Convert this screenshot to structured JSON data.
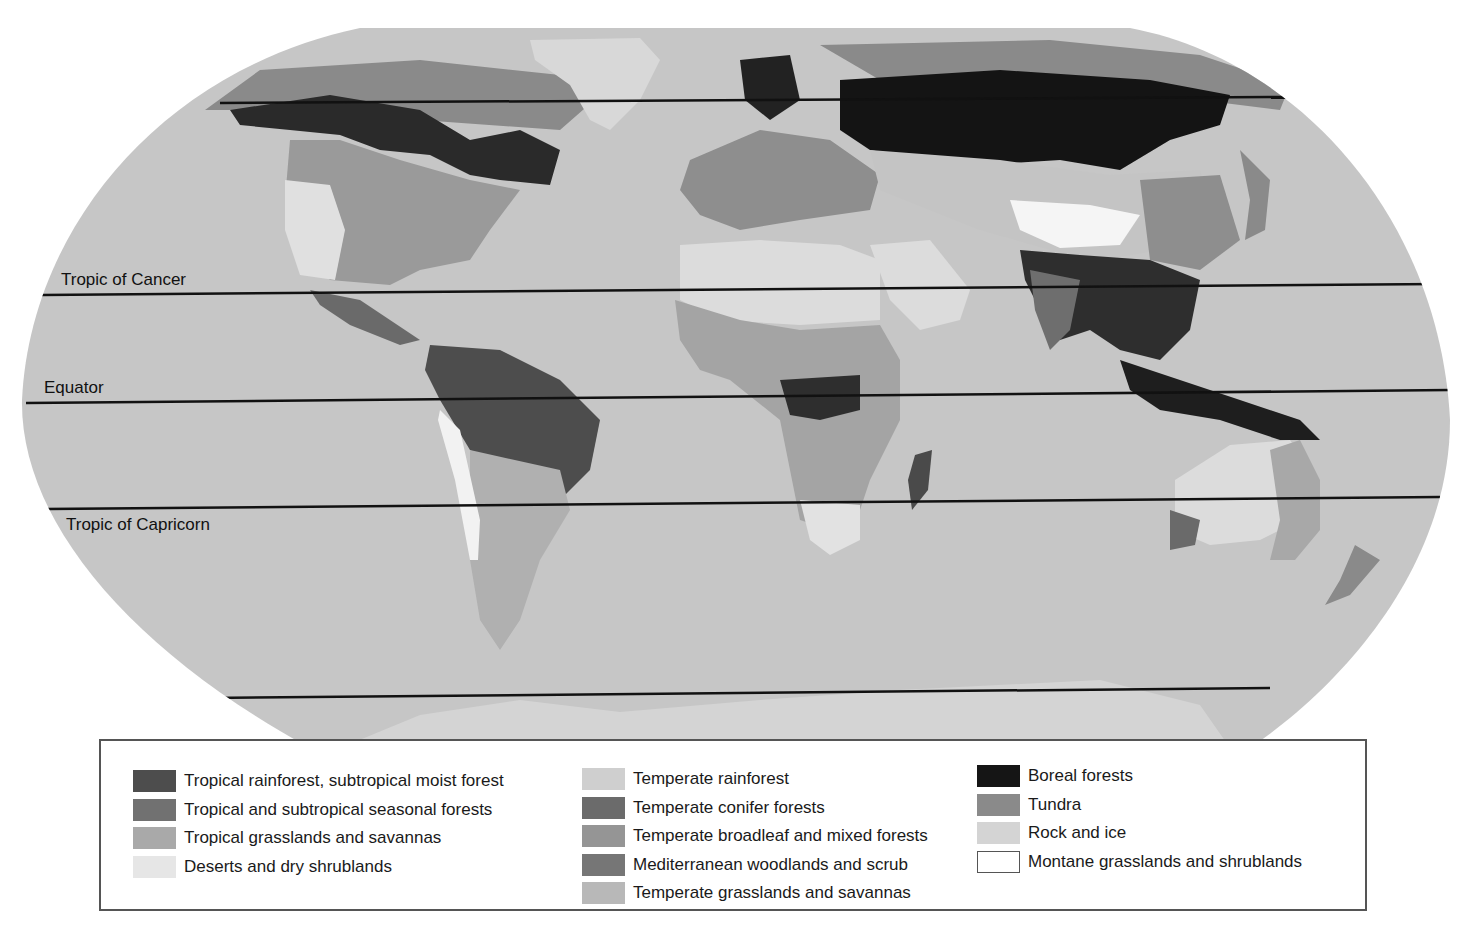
{
  "map": {
    "title": "World biomes map",
    "projection": "Robinson-like oval",
    "ocean_color": "#c6c6c6",
    "latitude_lines": [
      {
        "name": "Arctic Circle",
        "label": "",
        "y": 103
      },
      {
        "name": "Tropic of Cancer",
        "label": "Tropic of Cancer",
        "y": 289
      },
      {
        "name": "Equator",
        "label": "Equator",
        "y": 397
      },
      {
        "name": "Tropic of Capricorn",
        "label": "Tropic of Capricorn",
        "y": 503
      },
      {
        "name": "Antarctic Circle",
        "label": "",
        "y": 692
      }
    ]
  },
  "legend": {
    "columns": [
      [
        {
          "label": "Tropical rainforest, subtropical moist forest",
          "color": "#4d4d4d"
        },
        {
          "label": "Tropical and subtropical seasonal forests",
          "color": "#717171"
        },
        {
          "label": "Tropical grasslands and savannas",
          "color": "#a9a9a9"
        },
        {
          "label": "Deserts and dry shrublands",
          "color": "#e2e2e2"
        }
      ],
      [
        {
          "label": "Temperate rainforest",
          "color": "#cfcfcf"
        },
        {
          "label": "Temperate conifer forests",
          "color": "#6b6b6b"
        },
        {
          "label": "Temperate broadleaf and mixed forests",
          "color": "#959595"
        },
        {
          "label": "Mediterranean woodlands and scrub",
          "color": "#767676"
        },
        {
          "label": "Temperate grasslands and savannas",
          "color": "#b8b8b8"
        }
      ],
      [
        {
          "label": "Boreal forests",
          "color": "#151515"
        },
        {
          "label": "Tundra",
          "color": "#8a8a8a"
        },
        {
          "label": "Rock and ice",
          "color": "#d4d4d4"
        },
        {
          "label": "Montane grasslands and shrublands",
          "color": "#ffffff"
        }
      ]
    ]
  }
}
